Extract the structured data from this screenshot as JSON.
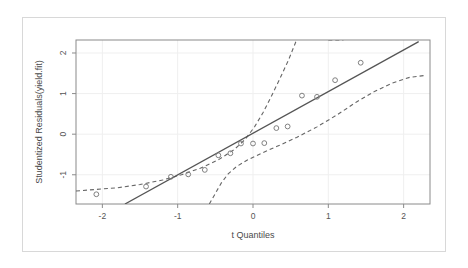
{
  "chart_data": {
    "type": "scatter",
    "title": "",
    "subtitle": "",
    "xlabel": "t Quantiles",
    "ylabel": "Studentized Residuals(yield.fit)",
    "xlim": [
      -2.35,
      2.35
    ],
    "ylim": [
      -1.72,
      2.32
    ],
    "xticks": [
      -2,
      -1,
      0,
      1,
      2
    ],
    "xticklabels": [
      "-2",
      "-1",
      "0",
      "1",
      "2"
    ],
    "yticks": [
      -1,
      0,
      1,
      2
    ],
    "yticklabels": [
      "-1",
      "0",
      "1",
      "2"
    ],
    "grid": true,
    "legend": null,
    "legend_position": "none",
    "series": [
      {
        "name": "Studentized residuals",
        "type": "scatter",
        "marker": "open-circle",
        "color": "#808080",
        "points": [
          {
            "x": -2.08,
            "y": -1.48
          },
          {
            "x": -1.42,
            "y": -1.29
          },
          {
            "x": -1.09,
            "y": -1.05
          },
          {
            "x": -0.86,
            "y": -0.99
          },
          {
            "x": -0.64,
            "y": -0.88
          },
          {
            "x": -0.46,
            "y": -0.52
          },
          {
            "x": -0.3,
            "y": -0.47
          },
          {
            "x": -0.16,
            "y": -0.23
          },
          {
            "x": 0.0,
            "y": -0.23
          },
          {
            "x": 0.15,
            "y": -0.22
          },
          {
            "x": 0.31,
            "y": 0.15
          },
          {
            "x": 0.46,
            "y": 0.19
          },
          {
            "x": 0.65,
            "y": 0.95
          },
          {
            "x": 0.85,
            "y": 0.92
          },
          {
            "x": 1.09,
            "y": 1.33
          },
          {
            "x": 1.43,
            "y": 1.76
          }
        ]
      },
      {
        "name": "Reference line",
        "type": "line",
        "style": "solid",
        "color": "#555555",
        "x_start": -1.7,
        "y_start": -1.72,
        "x_end": 2.2,
        "y_end": 2.28
      },
      {
        "name": "Upper confidence band",
        "type": "line",
        "style": "dashed",
        "color": "#666666",
        "points": [
          {
            "x": -2.35,
            "y": -1.4
          },
          {
            "x": -2.08,
            "y": -1.36
          },
          {
            "x": -1.8,
            "y": -1.32
          },
          {
            "x": -1.5,
            "y": -1.24
          },
          {
            "x": -1.2,
            "y": -1.13
          },
          {
            "x": -0.95,
            "y": -1.0
          },
          {
            "x": -0.7,
            "y": -0.84
          },
          {
            "x": -0.45,
            "y": -0.62
          },
          {
            "x": -0.25,
            "y": -0.38
          },
          {
            "x": -0.1,
            "y": -0.12
          },
          {
            "x": 0.02,
            "y": 0.18
          },
          {
            "x": 0.13,
            "y": 0.52
          },
          {
            "x": 0.24,
            "y": 0.92
          },
          {
            "x": 0.36,
            "y": 1.38
          },
          {
            "x": 0.47,
            "y": 1.82
          },
          {
            "x": 0.57,
            "y": 2.28
          }
        ]
      },
      {
        "name": "Lower confidence band",
        "type": "line",
        "style": "dashed",
        "color": "#666666",
        "points": [
          {
            "x": -0.58,
            "y": -1.72
          },
          {
            "x": -0.5,
            "y": -1.46
          },
          {
            "x": -0.42,
            "y": -1.2
          },
          {
            "x": -0.33,
            "y": -0.98
          },
          {
            "x": -0.22,
            "y": -0.8
          },
          {
            "x": -0.08,
            "y": -0.64
          },
          {
            "x": 0.1,
            "y": -0.48
          },
          {
            "x": 0.32,
            "y": -0.3
          },
          {
            "x": 0.58,
            "y": -0.08
          },
          {
            "x": 0.85,
            "y": 0.18
          },
          {
            "x": 1.12,
            "y": 0.48
          },
          {
            "x": 1.38,
            "y": 0.8
          },
          {
            "x": 1.62,
            "y": 1.06
          },
          {
            "x": 1.85,
            "y": 1.26
          },
          {
            "x": 2.08,
            "y": 1.4
          },
          {
            "x": 2.3,
            "y": 1.45
          }
        ]
      },
      {
        "name": "Upper confidence band right segment",
        "type": "line",
        "style": "dashed",
        "color": "#666666",
        "points": [
          {
            "x": 1.0,
            "y": 2.32
          },
          {
            "x": 1.2,
            "y": 2.32
          }
        ]
      }
    ]
  },
  "figure": {
    "background_color": "#ffffff",
    "frame_color": "#d8d8d8",
    "plot_border_color": "#8a8a8a",
    "grid_color": "#efefef",
    "point_color": "#808080",
    "line_color": "#555555",
    "band_color": "#666666"
  }
}
